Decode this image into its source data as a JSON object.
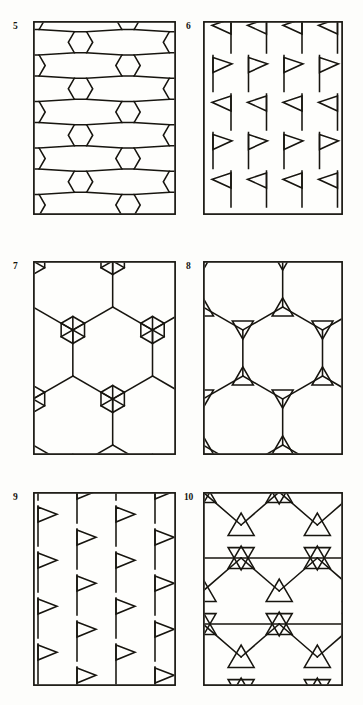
{
  "figure": {
    "background_color": "#fdfdfb",
    "ink_color": "#17150f",
    "panel_count": 6
  },
  "panels": [
    {
      "label": "5",
      "name": "panel-5",
      "motif": "hexagon-net",
      "description": "Net of small hexagons joined by short links enclosing large hexagonal voids",
      "box": {
        "x": 33,
        "y": 21,
        "w": 143,
        "h": 194
      },
      "label_pos": {
        "x": 13,
        "y": 22
      }
    },
    {
      "label": "6",
      "name": "panel-6",
      "motif": "pennant-alternating",
      "description": "Rows of pennant flags alternating left-pointing and right-pointing",
      "box": {
        "x": 203,
        "y": 21,
        "w": 140,
        "h": 194
      },
      "label_pos": {
        "x": 186,
        "y": 22
      }
    },
    {
      "label": "7",
      "name": "panel-7",
      "motif": "hexagon-rosette",
      "description": "Hexagonal net whose nodes carry six-spoke star rosettes inside small hexagons",
      "box": {
        "x": 33,
        "y": 261,
        "w": 143,
        "h": 194
      },
      "label_pos": {
        "x": 13,
        "y": 262
      }
    },
    {
      "label": "8",
      "name": "panel-8",
      "motif": "triangle-hexnet",
      "description": "Hexagonal net with triangles hung from each node",
      "box": {
        "x": 203,
        "y": 261,
        "w": 140,
        "h": 194
      },
      "label_pos": {
        "x": 186,
        "y": 262
      }
    },
    {
      "label": "9",
      "name": "panel-9",
      "motif": "pennant-uniform",
      "description": "Offset columns of right-pointing pennant flags",
      "box": {
        "x": 33,
        "y": 492,
        "w": 143,
        "h": 194
      },
      "label_pos": {
        "x": 13,
        "y": 493
      }
    },
    {
      "label": "10",
      "name": "panel-10",
      "motif": "triangle-star-lattice",
      "description": "Dense lattice of interlocking triangles surrounding hexagonal voids",
      "box": {
        "x": 203,
        "y": 492,
        "w": 140,
        "h": 194
      },
      "label_pos": {
        "x": 184,
        "y": 493
      }
    }
  ]
}
